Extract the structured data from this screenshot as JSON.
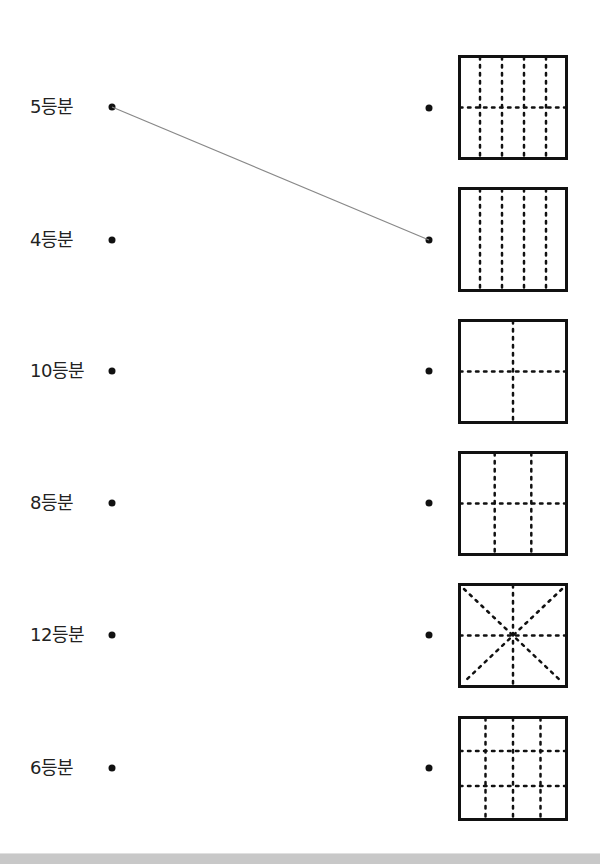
{
  "worksheet": {
    "left_items": [
      {
        "label": "5등분",
        "y": 107
      },
      {
        "label": "4등분",
        "y": 240
      },
      {
        "label": "10등분",
        "y": 371
      },
      {
        "label": "8등분",
        "y": 503
      },
      {
        "label": "12등분",
        "y": 635
      },
      {
        "label": "6등분",
        "y": 768
      }
    ],
    "right_items": [
      {
        "figure": "grid-5-columns-2-rows",
        "vertical_lines": 4,
        "horizontal_lines": 1,
        "diagonals": false,
        "parts": 10,
        "y": 108
      },
      {
        "figure": "grid-5-columns",
        "vertical_lines": 4,
        "horizontal_lines": 0,
        "diagonals": false,
        "parts": 5,
        "y": 240
      },
      {
        "figure": "grid-2-columns-2-rows",
        "vertical_lines": 1,
        "horizontal_lines": 1,
        "diagonals": false,
        "parts": 4,
        "y": 371
      },
      {
        "figure": "grid-3-columns-2-rows",
        "vertical_lines": 2,
        "horizontal_lines": 1,
        "diagonals": false,
        "parts": 6,
        "y": 503
      },
      {
        "figure": "cross-with-diagonals",
        "vertical_lines": 1,
        "horizontal_lines": 1,
        "diagonals": true,
        "parts": 8,
        "y": 635
      },
      {
        "figure": "grid-4-columns-3-rows",
        "vertical_lines": 3,
        "horizontal_lines": 2,
        "diagonals": false,
        "parts": 12,
        "y": 768
      }
    ],
    "connections": [
      {
        "from_left": 0,
        "to_right": 1,
        "color": "#888888"
      }
    ],
    "colors": {
      "text": "#222222",
      "dot": "#111111",
      "box_border": "#111111",
      "dotted_line": "#111111",
      "connector": "#888888",
      "bottom_bar": "#c8c8c8"
    }
  }
}
